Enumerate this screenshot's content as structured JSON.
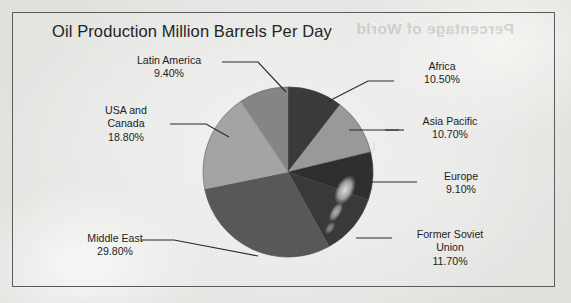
{
  "chart_data": {
    "type": "pie",
    "title": "Oil Production Million Barrels Per Day",
    "xlabel": "",
    "ylabel": "",
    "legend_position": "none",
    "grid": false,
    "value_suffix": "%",
    "categories": [
      "Africa",
      "Asia Pacific",
      "Europe",
      "Former Soviet Union",
      "Middle East",
      "USA and Canada",
      "Latin America"
    ],
    "values": [
      10.5,
      10.7,
      9.1,
      11.7,
      29.8,
      18.8,
      9.4
    ],
    "slices": [
      {
        "name": "Africa",
        "label_lines": [
          "Africa",
          "10.50%"
        ],
        "value": 10.5,
        "value_text": "10.50%",
        "color": "#3b3b3b",
        "start_angle": 0.0,
        "end_angle": 37.8
      },
      {
        "name": "Asia Pacific",
        "label_lines": [
          "Asia Pacific",
          "10.70%"
        ],
        "value": 10.7,
        "value_text": "10.70%",
        "color": "#9a9a9a",
        "start_angle": 37.8,
        "end_angle": 76.32
      },
      {
        "name": "Europe",
        "label_lines": [
          "Europe",
          "9.10%"
        ],
        "value": 9.1,
        "value_text": "9.10%",
        "color": "#2f2f2f",
        "start_angle": 76.32,
        "end_angle": 109.08
      },
      {
        "name": "Former Soviet Union",
        "label_lines": [
          "Former Soviet",
          "Union",
          "11.70%"
        ],
        "value": 11.7,
        "value_text": "11.70%",
        "color": "#3a3a3a",
        "start_angle": 109.08,
        "end_angle": 151.2
      },
      {
        "name": "Middle East",
        "label_lines": [
          "Middle East",
          "29.80%"
        ],
        "value": 29.8,
        "value_text": "29.80%",
        "color": "#595959",
        "start_angle": 151.2,
        "end_angle": 258.48
      },
      {
        "name": "USA and Canada",
        "label_lines": [
          "USA and",
          "Canada",
          "18.80%"
        ],
        "value": 18.8,
        "value_text": "18.80%",
        "color": "#a5a5a5",
        "start_angle": 258.48,
        "end_angle": 326.16
      },
      {
        "name": "Latin America",
        "label_lines": [
          "Latin America",
          "9.40%"
        ],
        "value": 9.4,
        "value_text": "9.40%",
        "color": "#868686",
        "start_angle": 326.16,
        "end_angle": 360.0
      }
    ]
  },
  "labels": {
    "latin_america": "Latin America\n9.40%",
    "usa_canada": "USA and\nCanada\n18.80%",
    "middle_east": "Middle East\n29.80%",
    "africa": "Africa\n10.50%",
    "asia_pacific": "Asia Pacific\n10.70%",
    "europe": "Europe\n9.10%",
    "former_soviet_union": "Former Soviet\nUnion\n11.70%"
  },
  "artifacts": {
    "bleed_through_text": "Percentage of World",
    "bleed_through_text_2": "Oil Production"
  },
  "colors": {
    "frame": "#5b5b5b",
    "title_text": "#242424",
    "label_text": "#1d1d1d",
    "leader_line": "#2a2a2a",
    "page_background": "#efefed"
  }
}
